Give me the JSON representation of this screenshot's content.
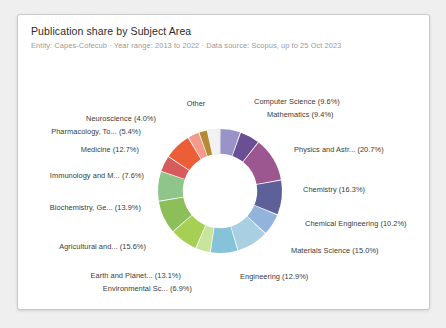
{
  "card": {
    "title": "Publication share by Subject Area",
    "subtitle": "Entity: Capes-Cofecub  ·  Year range: 2013 to 2022  ·  Data source: Scopus, up to 25 Oct 2023"
  },
  "chart_data": {
    "type": "pie",
    "variant": "donut",
    "title": "Publication share by Subject Area",
    "subtitle": "Entity: Capes-Cofecub  ·  Year range: 2013 to 2022  ·  Data source: Scopus, up to 25 Oct 2023",
    "value_unit": "percent",
    "start_angle_deg": 0,
    "direction": "clockwise",
    "inner_radius_ratio": 0.6,
    "legend": "none",
    "labels_mode": "outside-leader",
    "categories": [
      "Computer Science",
      "Mathematics",
      "Physics and Astr...",
      "Chemistry",
      "Chemical Engineering",
      "Materials Science",
      "Engineering",
      "Environmental Sc...",
      "Earth and Planet...",
      "Agricultural and...",
      "Biochemistry, Ge...",
      "Immunology and M...",
      "Medicine",
      "Pharmacology, To...",
      "Neuroscience",
      "Other"
    ],
    "values": [
      9.6,
      9.4,
      20.7,
      16.3,
      10.2,
      15.0,
      12.9,
      6.9,
      13.1,
      15.6,
      13.9,
      7.6,
      12.7,
      5.4,
      4.0,
      5.9
    ],
    "colors": [
      "#9a93c8",
      "#6a4f94",
      "#9c5790",
      "#5e6099",
      "#92b4dc",
      "#a9cfe2",
      "#86c2d8",
      "#c9e59c",
      "#a7cf54",
      "#8cbf5a",
      "#8fc48a",
      "#d85b5b",
      "#ec5f36",
      "#f49a8a",
      "#b58a32",
      "#f2f2f2"
    ],
    "slices": [
      {
        "label": "Computer Science (9.6%)",
        "name": "Computer Science",
        "value": 9.6,
        "color": "#9a93c8"
      },
      {
        "label": "Mathematics (9.4%)",
        "name": "Mathematics",
        "value": 9.4,
        "color": "#6a4f94"
      },
      {
        "label": "Physics and Astr... (20.7%)",
        "name": "Physics and Astr...",
        "value": 20.7,
        "color": "#9c5790"
      },
      {
        "label": "Chemistry (16.3%)",
        "name": "Chemistry",
        "value": 16.3,
        "color": "#5e6099"
      },
      {
        "label": "Chemical Engineering (10.2%)",
        "name": "Chemical Engineering",
        "value": 10.2,
        "color": "#92b4dc"
      },
      {
        "label": "Materials Science (15.0%)",
        "name": "Materials Science",
        "value": 15.0,
        "color": "#a9cfe2"
      },
      {
        "label": "Engineering (12.9%)",
        "name": "Engineering",
        "value": 12.9,
        "color": "#86c2d8"
      },
      {
        "label": "Environmental Sc... (6.9%)",
        "name": "Environmental Sc...",
        "value": 6.9,
        "color": "#c9e59c"
      },
      {
        "label": "Earth and Planet... (13.1%)",
        "name": "Earth and Planet...",
        "value": 13.1,
        "color": "#a7cf54"
      },
      {
        "label": "Agricultural and... (15.6%)",
        "name": "Agricultural and...",
        "value": 15.6,
        "color": "#8cbf5a"
      },
      {
        "label": "Biochemistry, Ge... (13.9%)",
        "name": "Biochemistry, Ge...",
        "value": 13.9,
        "color": "#8fc48a"
      },
      {
        "label": "Immunology and M... (7.6%)",
        "name": "Immunology and M...",
        "value": 7.6,
        "color": "#d85b5b"
      },
      {
        "label": "Medicine (12.7%)",
        "name": "Medicine",
        "value": 12.7,
        "color": "#ec5f36"
      },
      {
        "label": "Pharmacology, To... (5.4%)",
        "name": "Pharmacology, To...",
        "value": 5.4,
        "color": "#f49a8a"
      },
      {
        "label": "Neuroscience (4.0%)",
        "name": "Neuroscience",
        "value": 4.0,
        "color": "#b58a32"
      },
      {
        "label": "Other",
        "name": "Other",
        "value": 5.9,
        "color": "#f2f2f2"
      }
    ]
  },
  "label_positions": [
    {
      "x": 236,
      "y": 82,
      "align": "r"
    },
    {
      "x": 249,
      "y": 95,
      "align": "r"
    },
    {
      "x": 276,
      "y": 130,
      "align": "r"
    },
    {
      "x": 285,
      "y": 170,
      "align": "r"
    },
    {
      "x": 287,
      "y": 204,
      "align": "r"
    },
    {
      "x": 273,
      "y": 231,
      "align": "r"
    },
    {
      "x": 222,
      "y": 257,
      "align": "r"
    },
    {
      "x": 176,
      "y": 269,
      "align": "l"
    },
    {
      "x": 165,
      "y": 256,
      "align": "l"
    },
    {
      "x": 130,
      "y": 227,
      "align": "l"
    },
    {
      "x": 125,
      "y": 188,
      "align": "l"
    },
    {
      "x": 128,
      "y": 156,
      "align": "l"
    },
    {
      "x": 123,
      "y": 130,
      "align": "l"
    },
    {
      "x": 125,
      "y": 112,
      "align": "l"
    },
    {
      "x": 140,
      "y": 99,
      "align": "l"
    },
    {
      "x": 178,
      "y": 84,
      "align": "c"
    }
  ]
}
